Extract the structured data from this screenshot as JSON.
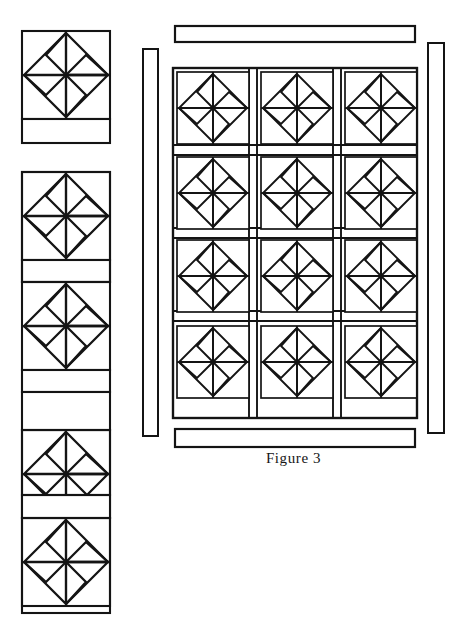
{
  "figure": {
    "caption": "Figure 3",
    "background_color": "#ffffff",
    "line_color": "#141414",
    "canvas": {
      "width": 471,
      "height": 631
    }
  },
  "motif": {
    "name": "pinwheel-block",
    "description": "Square block with horizontal and vertical center lines and four rotating arrow blades",
    "blade_count": 4,
    "rotation": "clockwise",
    "block_size_px": 88
  },
  "panels": [
    {
      "id": "left-strip",
      "name": "left-vertical-strip",
      "x": 22,
      "y": 31,
      "width": 88,
      "label": "Left border strip of pinwheel blocks",
      "groups": [
        {
          "blocks": 1,
          "y": 31,
          "sashing_below": true
        },
        {
          "blocks": 1,
          "y": 172,
          "sashing_below": false
        },
        {
          "blocks": 1,
          "y": 260,
          "sashing_below": true
        },
        {
          "blocks": 1,
          "y": 345,
          "sashing_below": true
        },
        {
          "blocks": 1,
          "y": 430,
          "sashing_below": true
        },
        {
          "blocks": 1,
          "y": 518,
          "sashing_below": false
        }
      ]
    },
    {
      "id": "inner-sash-left",
      "name": "left-narrow-sashing-bar",
      "x": 143,
      "y": 49,
      "width": 15,
      "height": 387,
      "label": "Narrow vertical sashing strip"
    },
    {
      "id": "inner-sash-right",
      "name": "right-narrow-sashing-bar",
      "x": 428,
      "y": 43,
      "width": 16,
      "height": 390,
      "label": "Narrow vertical sashing strip"
    },
    {
      "id": "top-border",
      "name": "top-horizontal-border-bar",
      "x": 175,
      "y": 26,
      "width": 240,
      "height": 16,
      "label": "Top horizontal border strip"
    },
    {
      "id": "bottom-border",
      "name": "bottom-horizontal-border-bar",
      "x": 175,
      "y": 429,
      "width": 240,
      "height": 18,
      "label": "Bottom horizontal border strip"
    },
    {
      "id": "main-quilt",
      "name": "main-quilt-grid",
      "x": 173,
      "y": 68,
      "width": 244,
      "height": 350,
      "columns": 3,
      "rows": 4,
      "label": "Main quilt top: 3 columns by 4 rows of pinwheel blocks with sashing"
    }
  ],
  "grid": {
    "col_x": [
      177,
      261,
      345
    ],
    "row_y": [
      72,
      155,
      238,
      325
    ],
    "cell_size": 72,
    "sash_width": 12
  }
}
